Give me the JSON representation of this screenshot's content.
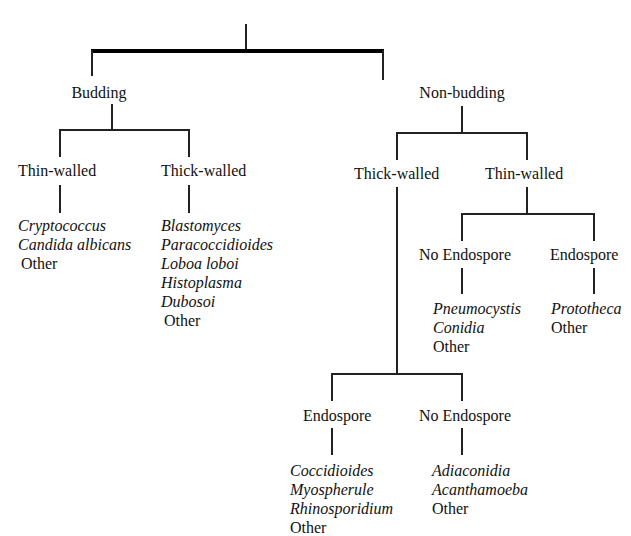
{
  "header": {
    "title_clipped": ""
  },
  "tree": {
    "root": {
      "children": [
        {
          "label": "Budding",
          "children": [
            {
              "label": "Thin-walled",
              "items": [
                "Cryptococcus",
                "Candida albicans"
              ],
              "other": "Other"
            },
            {
              "label": "Thick-walled",
              "items": [
                "Blastomyces",
                "Paracoccidioides",
                "Loboa loboi",
                "Histoplasma",
                "Dubosoi"
              ],
              "other": "Other"
            }
          ]
        },
        {
          "label": "Non-budding",
          "children": [
            {
              "label": "Thick-walled",
              "children": [
                {
                  "label": "Endospore",
                  "items": [
                    "Coccidioides",
                    "Myospherule",
                    "Rhinosporidium"
                  ],
                  "other": "Other"
                },
                {
                  "label": "No Endospore",
                  "items": [
                    "Adiaconidia",
                    "Acanthamoeba"
                  ],
                  "other": "Other"
                }
              ]
            },
            {
              "label": "Thin-walled",
              "children": [
                {
                  "label": "No Endospore",
                  "items": [
                    "Pneumocystis",
                    "Conidia"
                  ],
                  "other": "Other"
                },
                {
                  "label": "Endospore",
                  "items": [
                    "Prototheca"
                  ],
                  "other": "Other"
                }
              ]
            }
          ]
        }
      ]
    }
  }
}
